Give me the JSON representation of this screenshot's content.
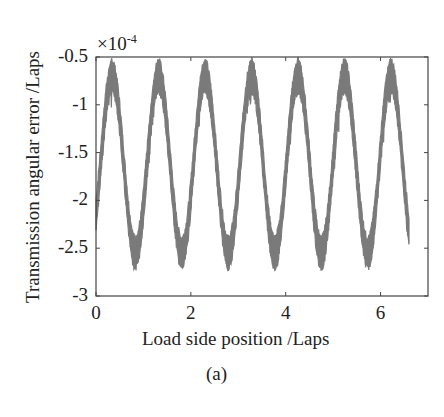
{
  "chart_data": {
    "type": "line",
    "title": "",
    "caption": "(a)",
    "xlabel": "Load side position /Laps",
    "ylabel": "Transmission angular error /Laps",
    "y_exponent_label": "×10",
    "y_exponent_power": "-4",
    "xlim": [
      0,
      7
    ],
    "ylim": [
      -3,
      -0.5
    ],
    "x_ticks": [
      0,
      2,
      4,
      6
    ],
    "x_tick_labels": [
      "0",
      "2",
      "4",
      "6"
    ],
    "y_ticks": [
      -0.5,
      -1,
      -1.5,
      -2,
      -2.5,
      -3
    ],
    "y_tick_labels": [
      "-0.5",
      "-1",
      "-1.5",
      "-2",
      "-2.5",
      "-3"
    ],
    "grid": false,
    "legend": null,
    "series": [
      {
        "name": "transmission angular error",
        "color": "#7a7a7a",
        "description": "noisy periodic signal, period ~0.98 laps, x from 0 to ~6.6",
        "x_start": 0,
        "x_end": 6.6,
        "period": 0.98,
        "first_peak_x": 0.34,
        "peak_value": -0.55,
        "trough_value": -2.7,
        "band_width": 0.3,
        "peaks_x": [
          0.34,
          1.32,
          2.3,
          3.28,
          4.26,
          5.24,
          6.22
        ],
        "troughs_x": [
          0.83,
          1.81,
          2.79,
          3.77,
          4.75,
          5.73
        ],
        "start_value": -2.3,
        "end_value": -1.2
      }
    ]
  }
}
